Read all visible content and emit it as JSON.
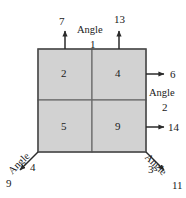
{
  "figure": {
    "colors": {
      "cell_fill": "#d2d2d2",
      "cell_border": "#6b6b6b",
      "outline": "#4a4a4a",
      "arrow": "#2b2b2b",
      "text": "#1a1a1a",
      "background": "#ffffff"
    },
    "cells": [
      {
        "name": "top-left",
        "label": "2"
      },
      {
        "name": "top-right",
        "label": "4"
      },
      {
        "name": "bottom-left",
        "label": "5"
      },
      {
        "name": "bottom-right",
        "label": "9"
      }
    ],
    "arrows": [
      {
        "name": "top-left-arrow",
        "label": "7",
        "direction": "up"
      },
      {
        "name": "top-right-arrow",
        "label": "13",
        "direction": "up"
      },
      {
        "name": "right-upper-arrow",
        "label": "6",
        "direction": "right"
      },
      {
        "name": "right-lower-arrow",
        "label": "14",
        "direction": "right"
      },
      {
        "name": "bottom-left-arrow",
        "label": "9",
        "direction": "down-left"
      },
      {
        "name": "bottom-right-arrow",
        "label": "11",
        "direction": "down-right"
      }
    ],
    "angles": [
      {
        "name": "angle-1",
        "word": "Angle",
        "number": "1"
      },
      {
        "name": "angle-2",
        "word": "Angle",
        "number": "2"
      },
      {
        "name": "angle-3",
        "word": "Angle",
        "number": "3"
      },
      {
        "name": "angle-4",
        "word": "Angle",
        "number": "4"
      }
    ],
    "corner_numbers": [
      {
        "name": "corner-number-left",
        "label": "4"
      },
      {
        "name": "corner-number-right",
        "label": "3"
      }
    ]
  }
}
